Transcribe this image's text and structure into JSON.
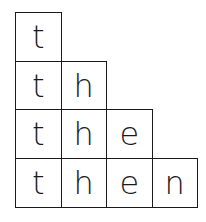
{
  "diagram": {
    "title": "",
    "rows": [
      [
        "t"
      ],
      [
        "t",
        "h"
      ],
      [
        "t",
        "h",
        "e"
      ],
      [
        "t",
        "h",
        "e",
        "n"
      ]
    ],
    "cell_width": 45,
    "cell_height": 48.5,
    "border_color": "#1a1a1a",
    "text_color": "#1a1a1a"
  }
}
